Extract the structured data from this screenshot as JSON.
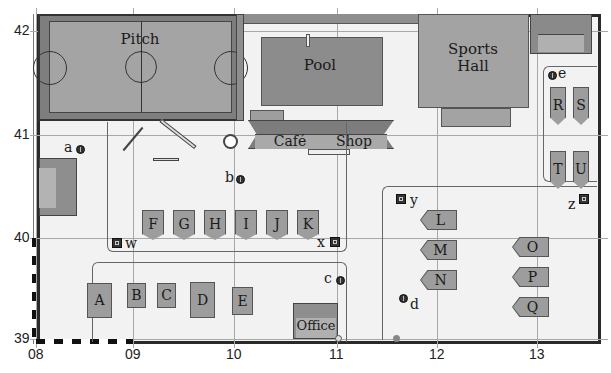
{
  "map": {
    "axes": {
      "x_ticks": [
        "08",
        "09",
        "10",
        "11",
        "12",
        "13"
      ],
      "y_ticks": [
        "42",
        "41",
        "40",
        "39"
      ]
    },
    "buildings": {
      "pitch": "Pitch",
      "pool": "Pool",
      "sports_hall_line1": "Sports",
      "sports_hall_line2": "Hall",
      "cafe": "Café",
      "shop": "Shop",
      "office": "Office"
    },
    "pitches_rect": [
      "A",
      "B",
      "C",
      "D",
      "E"
    ],
    "pitches_tent_row1": [
      "F",
      "G",
      "H",
      "I",
      "J",
      "K"
    ],
    "pitches_tent_right": [
      "R",
      "S",
      "T",
      "U"
    ],
    "pitches_arrow_left": [
      "L",
      "M",
      "N"
    ],
    "pitches_arrow_right": [
      "O",
      "P",
      "Q"
    ],
    "points_round": [
      "a",
      "b",
      "c",
      "d",
      "e"
    ],
    "points_square": [
      "w",
      "x",
      "y",
      "z"
    ],
    "colors": {
      "building_gray": "#9e9e9e",
      "background": "#f2f2f2",
      "border": "#2a2a2a",
      "grid": "#a8a8a8"
    }
  }
}
